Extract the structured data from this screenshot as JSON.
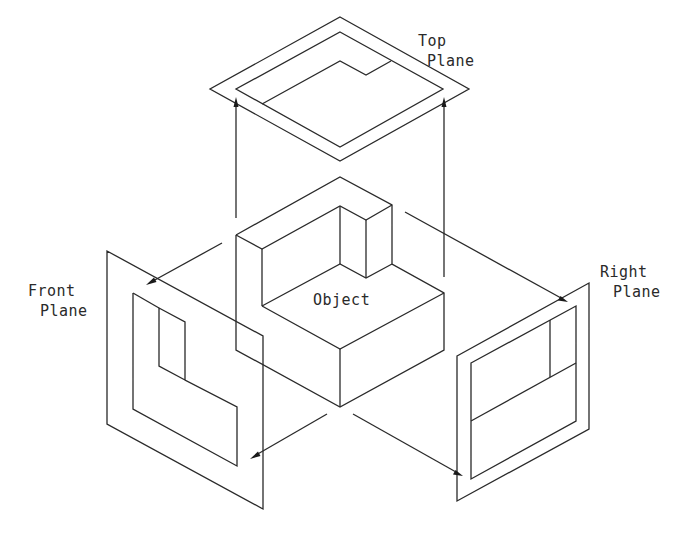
{
  "diagram": {
    "type": "orthographic-projection",
    "labels": {
      "top_plane": [
        "Top",
        "Plane"
      ],
      "front_plane": [
        "Front",
        "Plane"
      ],
      "right_plane": [
        "Right",
        "Plane"
      ],
      "object": "Object"
    },
    "planes": [
      "Top Plane",
      "Front Plane",
      "Right Plane"
    ],
    "projection_arrows": [
      {
        "from": "Object",
        "to": "Top Plane",
        "count": 2
      },
      {
        "from": "Object",
        "to": "Front Plane",
        "count": 2
      },
      {
        "from": "Object",
        "to": "Right Plane",
        "count": 2
      }
    ],
    "colors": {
      "line": "#2a2a2a",
      "background": "#ffffff"
    }
  }
}
